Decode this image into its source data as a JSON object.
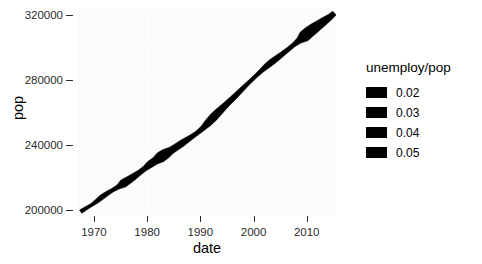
{
  "chart_data": {
    "type": "line",
    "title": "",
    "xlabel": "date",
    "ylabel": "pop",
    "xlim": [
      1967,
      2015.5
    ],
    "ylim": [
      196000,
      324000
    ],
    "grid": true,
    "legend_position": "right",
    "legend": {
      "title": "unemploy/pop",
      "entries": [
        {
          "label": "0.02",
          "color": "#000000"
        },
        {
          "label": "0.03",
          "color": "#000000"
        },
        {
          "label": "0.04",
          "color": "#000000"
        },
        {
          "label": "0.05",
          "color": "#000000"
        }
      ]
    },
    "xticks": [
      1970,
      1980,
      1990,
      2000,
      2010
    ],
    "xtick_labels": [
      "1970",
      "1980",
      "1990",
      "2000",
      "2010"
    ],
    "yticks": [
      200000,
      240000,
      280000,
      320000
    ],
    "ytick_labels": [
      "200000",
      "240000",
      "280000",
      "320000"
    ],
    "series": [
      {
        "name": "pop",
        "size_variable": "unemploy/pop",
        "color": "#000000",
        "x": [
          1967.5,
          1968.5,
          1969.5,
          1970.5,
          1971.5,
          1972.5,
          1973.5,
          1974.5,
          1975.5,
          1976.5,
          1977.5,
          1978.5,
          1979.5,
          1980.5,
          1981.5,
          1982.5,
          1983.5,
          1984.5,
          1985.5,
          1986.5,
          1987.5,
          1988.5,
          1989.5,
          1990.5,
          1991.5,
          1992.5,
          1993.5,
          1994.5,
          1995.5,
          1996.5,
          1997.5,
          1998.5,
          1999.5,
          2000.5,
          2001.5,
          2002.5,
          2003.5,
          2004.5,
          2005.5,
          2006.5,
          2007.5,
          2008.5,
          2009.5,
          2010.5,
          2011.5,
          2012.5,
          2013.5,
          2014.5,
          2015.2
        ],
        "y": [
          198712,
          200706,
          202677,
          205052,
          207661,
          209896,
          211909,
          213805,
          215973,
          218035,
          220239,
          222585,
          225055,
          227726,
          229966,
          232188,
          234307,
          236348,
          238466,
          240651,
          242804,
          245021,
          247342,
          250132,
          253493,
          256894,
          260255,
          263436,
          266557,
          269667,
          272912,
          276115,
          279295,
          282398,
          285470,
          288369,
          290941,
          293392,
          295896,
          298475,
          301148,
          303826,
          306547,
          309347,
          311721,
          314102,
          316427,
          318748,
          320887
        ],
        "size": [
          0.0225,
          0.0216,
          0.0201,
          0.0237,
          0.0259,
          0.0244,
          0.0219,
          0.0245,
          0.0364,
          0.0338,
          0.0312,
          0.0272,
          0.0264,
          0.0329,
          0.034,
          0.044,
          0.0415,
          0.0328,
          0.0318,
          0.0314,
          0.0283,
          0.0251,
          0.0243,
          0.0268,
          0.0336,
          0.0363,
          0.0341,
          0.0303,
          0.0282,
          0.0272,
          0.0253,
          0.0236,
          0.0226,
          0.0222,
          0.024,
          0.0287,
          0.0298,
          0.028,
          0.0258,
          0.024,
          0.024,
          0.0296,
          0.0465,
          0.0452,
          0.0427,
          0.0382,
          0.0341,
          0.0293,
          0.0264
        ]
      }
    ]
  }
}
